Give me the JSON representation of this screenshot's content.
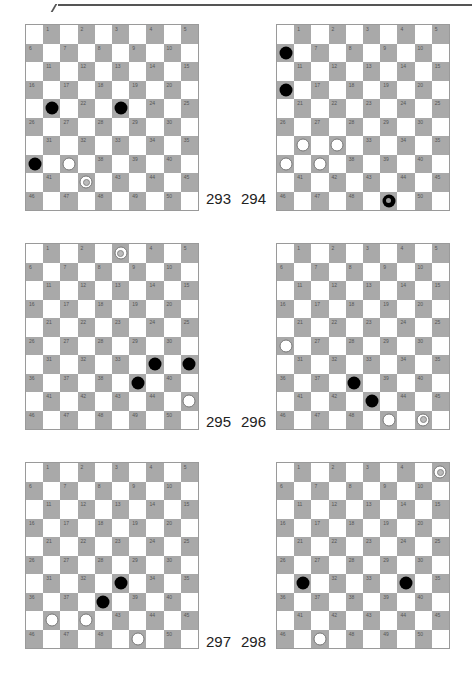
{
  "page": {
    "diagrams": [
      {
        "number": "293",
        "label_pos": "right",
        "left": 25,
        "top": 24,
        "label_x": 206,
        "label_y": 191,
        "black": [
          21,
          23,
          36
        ],
        "white": [
          37
        ],
        "white_kings": [
          42
        ],
        "black_kings": []
      },
      {
        "number": "294",
        "label_pos": "left",
        "left": 276,
        "top": 24,
        "label_x": 241,
        "label_y": 191,
        "black": [
          6,
          16
        ],
        "white": [
          31,
          32,
          36,
          37
        ],
        "white_kings": [],
        "black_kings": [
          49
        ]
      },
      {
        "number": "295",
        "label_pos": "right",
        "left": 25,
        "top": 243,
        "label_x": 206,
        "label_y": 414,
        "black": [
          34,
          35,
          39
        ],
        "white": [
          45
        ],
        "white_kings": [
          3
        ],
        "black_kings": []
      },
      {
        "number": "296",
        "label_pos": "left",
        "left": 276,
        "top": 243,
        "label_x": 241,
        "label_y": 414,
        "black": [
          38,
          43
        ],
        "white": [
          26,
          49
        ],
        "white_kings": [
          50
        ],
        "black_kings": []
      },
      {
        "number": "297",
        "label_pos": "right",
        "left": 25,
        "top": 462,
        "label_x": 206,
        "label_y": 634,
        "black": [
          33,
          38
        ],
        "white": [
          41,
          42,
          49
        ],
        "white_kings": [],
        "black_kings": []
      },
      {
        "number": "298",
        "label_pos": "left",
        "left": 276,
        "top": 462,
        "label_x": 241,
        "label_y": 634,
        "black": [
          31,
          34
        ],
        "white": [
          47
        ],
        "white_kings": [
          5
        ],
        "black_kings": []
      }
    ],
    "colors": {
      "dark_square": "#a9a9a9",
      "light_square": "#ffffff",
      "black_piece": "#000000",
      "white_piece": "#ffffff"
    }
  }
}
